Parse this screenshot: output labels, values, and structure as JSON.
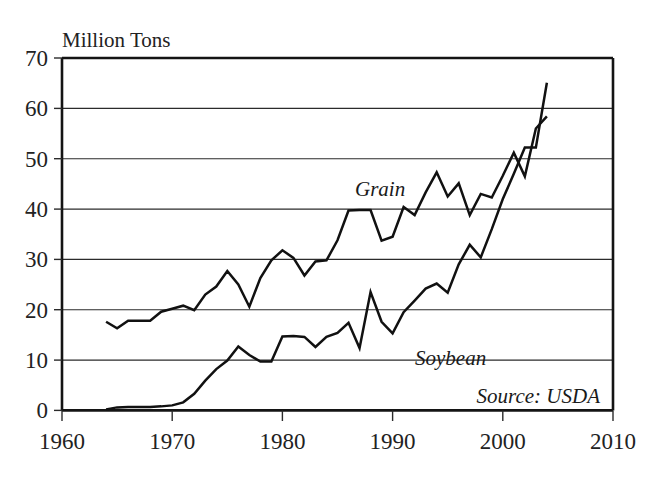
{
  "figure": {
    "background_color": "#ffffff",
    "ink_color": "#111111",
    "unit_label": "Million Tons"
  },
  "chart_data": {
    "type": "line",
    "title": "",
    "subtitle": "",
    "xlabel": "",
    "ylabel": "Million Tons",
    "xlim": [
      1960,
      2010
    ],
    "ylim": [
      0,
      70
    ],
    "xticks": [
      1960,
      1970,
      1980,
      1990,
      2000,
      2010
    ],
    "xticklabels": [
      "1960",
      "1970",
      "1980",
      "1990",
      "2000",
      "2010"
    ],
    "yticks": [
      0,
      10,
      20,
      30,
      40,
      50,
      60,
      70
    ],
    "yticklabels": [
      "0",
      "10",
      "20",
      "30",
      "40",
      "50",
      "60",
      "70"
    ],
    "grid": "horizontal",
    "legend_position": "inline-annotations",
    "annotations": [
      {
        "text": "Grain",
        "x": 1988,
        "y": 45.5,
        "style": "italic"
      },
      {
        "text": "Soybean",
        "x": 1993.5,
        "y": 16.5,
        "style": "italic"
      },
      {
        "text": "Source: USDA",
        "x": 2002.5,
        "y": 4.0,
        "style": "italic"
      }
    ],
    "x": [
      1964,
      1965,
      1966,
      1967,
      1968,
      1969,
      1970,
      1971,
      1972,
      1973,
      1974,
      1975,
      1976,
      1977,
      1978,
      1979,
      1980,
      1981,
      1982,
      1983,
      1984,
      1985,
      1986,
      1987,
      1988,
      1989,
      1990,
      1991,
      1992,
      1993,
      1994,
      1995,
      1996,
      1997,
      1998,
      1999,
      2000,
      2001,
      2002,
      2003,
      2004
    ],
    "series": [
      {
        "name": "Grain",
        "color": "#111111",
        "values": [
          17.6,
          16.3,
          17.8,
          17.8,
          17.8,
          19.6,
          20.2,
          20.8,
          19.9,
          23.0,
          24.6,
          27.7,
          25.0,
          20.6,
          26.3,
          29.8,
          31.8,
          30.3,
          26.8,
          29.6,
          29.8,
          33.8,
          39.7,
          39.8,
          39.8,
          33.7,
          34.5,
          40.4,
          38.8,
          43.3,
          47.3,
          42.5,
          45.1,
          38.8,
          43.0,
          42.3,
          46.6,
          51.2,
          46.5,
          56.0,
          58.4
        ]
      },
      {
        "name": "Soybean",
        "color": "#111111",
        "values": [
          0.2,
          0.6,
          0.7,
          0.7,
          0.7,
          0.8,
          1.0,
          1.6,
          3.3,
          5.9,
          8.2,
          9.9,
          12.7,
          11.0,
          9.7,
          9.7,
          14.7,
          14.8,
          14.6,
          12.6,
          14.6,
          15.4,
          17.4,
          12.4,
          23.5,
          17.6,
          15.3,
          19.5,
          21.8,
          24.2,
          25.2,
          23.4,
          29.0,
          32.9,
          30.4,
          36.0,
          42.0,
          47.0,
          52.2,
          52.2,
          65.1
        ]
      }
    ]
  }
}
